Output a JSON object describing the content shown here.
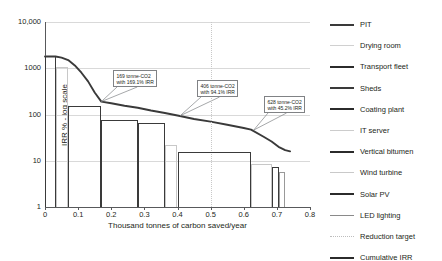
{
  "chart_data": {
    "type": "bar",
    "title": "",
    "xlabel": "Thousand tonnes of carbon saved/year",
    "ylabel": "IRR % - log scale",
    "xlim": [
      0,
      0.8
    ],
    "ylim": [
      1,
      10000
    ],
    "yscale": "log",
    "grid": true,
    "legend_position": "right",
    "ytick_labels": [
      "1",
      "10",
      "100",
      "1000",
      "10,000"
    ],
    "ytick_values": [
      1,
      10,
      100,
      1000,
      10000
    ],
    "xtick_labels": [
      "0",
      "0.1",
      "0.2",
      "0.3",
      "0.4",
      "0.5",
      "0.6",
      "0.7",
      "0.8"
    ],
    "xtick_values": [
      0,
      0.1,
      0.2,
      0.3,
      0.4,
      0.5,
      0.6,
      0.7,
      0.8
    ],
    "bars": [
      {
        "name": "PIT",
        "x_start": 0.0,
        "x_end": 0.032,
        "irr": 1800,
        "color": "#3a3a3a"
      },
      {
        "name": "Drying room",
        "x_start": 0.032,
        "x_end": 0.068,
        "irr": 1050,
        "color": "#c8c8c8"
      },
      {
        "name": "Transport fleet",
        "x_start": 0.068,
        "x_end": 0.17,
        "irr": 150,
        "color": "#3a3a3a"
      },
      {
        "name": "Sheds",
        "x_start": 0.17,
        "x_end": 0.28,
        "irr": 76,
        "color": "#3a3a3a"
      },
      {
        "name": "Coating plant",
        "x_start": 0.28,
        "x_end": 0.362,
        "irr": 67,
        "color": "#3a3a3a"
      },
      {
        "name": "IT server",
        "x_start": 0.362,
        "x_end": 0.4,
        "irr": 22,
        "color": "#c8c8c8"
      },
      {
        "name": "Vertical bitumen",
        "x_start": 0.4,
        "x_end": 0.622,
        "irr": 15.5,
        "color": "#3a3a3a"
      },
      {
        "name": "Wind turbine",
        "x_start": 0.622,
        "x_end": 0.684,
        "irr": 8.6,
        "color": "#c8c8c8"
      },
      {
        "name": "Solar PV",
        "x_start": 0.684,
        "x_end": 0.705,
        "irr": 7.3,
        "color": "#3a3a3a"
      },
      {
        "name": "LED lighting",
        "x_start": 0.705,
        "x_end": 0.725,
        "irr": 5.8,
        "color": "#999999"
      }
    ],
    "cumulative_irr": {
      "name": "Cumulative IRR",
      "color": "#3a3a3a",
      "points": [
        [
          0.0,
          1800
        ],
        [
          0.032,
          1800
        ],
        [
          0.05,
          1700
        ],
        [
          0.07,
          1500
        ],
        [
          0.09,
          1150
        ],
        [
          0.11,
          800
        ],
        [
          0.13,
          520
        ],
        [
          0.15,
          300
        ],
        [
          0.17,
          190
        ],
        [
          0.2,
          175
        ],
        [
          0.24,
          155
        ],
        [
          0.28,
          140
        ],
        [
          0.32,
          122
        ],
        [
          0.362,
          108
        ],
        [
          0.4,
          95
        ],
        [
          0.45,
          80
        ],
        [
          0.5,
          70
        ],
        [
          0.55,
          60
        ],
        [
          0.6,
          51
        ],
        [
          0.622,
          47
        ],
        [
          0.66,
          33
        ],
        [
          0.684,
          26
        ],
        [
          0.705,
          20
        ],
        [
          0.725,
          17
        ],
        [
          0.74,
          16
        ]
      ]
    },
    "reduction_target": {
      "name": "Reduction target",
      "x": 0.5,
      "color": "#c8c8c8",
      "style": "dotted"
    },
    "annotations": [
      {
        "id": "annotation-169",
        "line1": "169 tonne-CO2",
        "line2": "with 169.1% IRR",
        "point_x": 0.17,
        "point_y": 190,
        "box_left_px": 113,
        "box_top_px": 70
      },
      {
        "id": "annotation-406",
        "line1": "406 tonne-CO2",
        "line2": "with 94.1% IRR",
        "point_x": 0.408,
        "point_y": 94,
        "box_left_px": 197,
        "box_top_px": 80
      },
      {
        "id": "annotation-628",
        "line1": "628 tonne-CO2",
        "line2": "with 45.2% IRR",
        "point_x": 0.63,
        "point_y": 46,
        "box_left_px": 264,
        "box_top_px": 96
      }
    ]
  },
  "legend": {
    "items": [
      {
        "label": "PIT",
        "color": "#3a3a3a",
        "thickness": 2.2,
        "style": "solid"
      },
      {
        "label": "Drying room",
        "color": "#d0d0d0",
        "thickness": 1.3,
        "style": "solid"
      },
      {
        "label": "Transport fleet",
        "color": "#2b2b2b",
        "thickness": 2.6,
        "style": "solid"
      },
      {
        "label": "Sheds",
        "color": "#3a3a3a",
        "thickness": 2.0,
        "style": "solid"
      },
      {
        "label": "Coating plant",
        "color": "#2b2b2b",
        "thickness": 2.8,
        "style": "solid"
      },
      {
        "label": "IT server",
        "color": "#cccccc",
        "thickness": 1.5,
        "style": "solid"
      },
      {
        "label": "Vertical bitumen",
        "color": "#2b2b2b",
        "thickness": 2.4,
        "style": "solid"
      },
      {
        "label": "Wind turbine",
        "color": "#c9c9c9",
        "thickness": 1.8,
        "style": "solid"
      },
      {
        "label": "Solar PV",
        "color": "#2b2b2b",
        "thickness": 2.4,
        "style": "solid"
      },
      {
        "label": "LED lighting",
        "color": "#8a8a8a",
        "thickness": 1.4,
        "style": "solid"
      },
      {
        "label": "Reduction target",
        "color": "#bdbdbd",
        "thickness": 1.4,
        "style": "dotted"
      },
      {
        "label": "Cumulative IRR",
        "color": "#2b2b2b",
        "thickness": 2.6,
        "style": "solid"
      }
    ]
  }
}
